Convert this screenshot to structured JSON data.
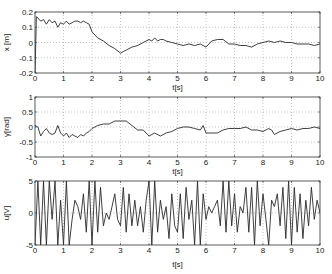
{
  "chart_data": [
    {
      "type": "line",
      "title": "",
      "xlabel": "t[s]",
      "ylabel": "x [m]",
      "xlim": [
        0,
        10
      ],
      "ylim": [
        -0.2,
        0.2
      ],
      "xticks": [
        "0",
        "1",
        "2",
        "3",
        "4",
        "5",
        "6",
        "7",
        "8",
        "9",
        "10"
      ],
      "yticks": [
        "-0.2",
        "-0.1",
        "0",
        "0.1",
        "0.2"
      ],
      "grid": true,
      "series": [
        {
          "name": "x",
          "x": [
            0,
            0.05,
            0.1,
            0.2,
            0.3,
            0.4,
            0.5,
            0.6,
            0.7,
            0.8,
            0.9,
            1.0,
            1.1,
            1.2,
            1.3,
            1.4,
            1.5,
            1.6,
            1.7,
            1.8,
            1.9,
            2.0,
            2.2,
            2.4,
            2.6,
            2.8,
            3.0,
            3.1,
            3.2,
            3.4,
            3.6,
            3.8,
            4.0,
            4.1,
            4.2,
            4.3,
            4.4,
            4.5,
            4.6,
            4.8,
            5.0,
            5.2,
            5.4,
            5.6,
            5.8,
            6.0,
            6.2,
            6.4,
            6.6,
            6.8,
            7.0,
            7.2,
            7.4,
            7.6,
            7.8,
            8.0,
            8.2,
            8.4,
            8.6,
            8.8,
            9.0,
            9.2,
            9.4,
            9.6,
            9.8,
            10.0
          ],
          "y": [
            -0.2,
            0.17,
            0.16,
            0.14,
            0.15,
            0.12,
            0.15,
            0.13,
            0.14,
            0.1,
            0.13,
            0.12,
            0.14,
            0.12,
            0.13,
            0.14,
            0.14,
            0.13,
            0.14,
            0.13,
            0.12,
            0.07,
            0.03,
            0.01,
            -0.02,
            -0.04,
            -0.07,
            -0.06,
            -0.05,
            -0.03,
            -0.02,
            0.0,
            0.02,
            0.01,
            0.03,
            0.01,
            0.02,
            0.02,
            0.01,
            0.0,
            -0.01,
            -0.02,
            -0.01,
            -0.02,
            -0.01,
            -0.03,
            0.01,
            0.02,
            0.02,
            -0.01,
            -0.01,
            -0.02,
            -0.02,
            -0.03,
            -0.01,
            0.0,
            0.01,
            0.0,
            0.01,
            0.0,
            0.0,
            -0.01,
            -0.01,
            -0.01,
            -0.02,
            -0.01
          ]
        }
      ]
    },
    {
      "type": "line",
      "title": "",
      "xlabel": "t[s]",
      "ylabel": "γ[rad]",
      "xlim": [
        0,
        10
      ],
      "ylim": [
        -1,
        1
      ],
      "xticks": [
        "0",
        "1",
        "2",
        "3",
        "4",
        "5",
        "6",
        "7",
        "8",
        "9",
        "10"
      ],
      "yticks": [
        "-1",
        "-0.5",
        "0",
        "0.5",
        "1"
      ],
      "grid": true,
      "series": [
        {
          "name": "gamma",
          "x": [
            0,
            0.1,
            0.2,
            0.3,
            0.4,
            0.5,
            0.6,
            0.7,
            0.8,
            0.9,
            1.0,
            1.1,
            1.2,
            1.3,
            1.4,
            1.5,
            1.6,
            1.7,
            1.8,
            1.9,
            2.0,
            2.2,
            2.4,
            2.6,
            2.8,
            3.0,
            3.2,
            3.4,
            3.6,
            3.8,
            4.0,
            4.2,
            4.4,
            4.6,
            4.8,
            5.0,
            5.2,
            5.4,
            5.6,
            5.8,
            5.9,
            6.0,
            6.2,
            6.4,
            6.6,
            6.8,
            7.0,
            7.2,
            7.4,
            7.6,
            7.8,
            8.0,
            8.2,
            8.3,
            8.4,
            8.6,
            8.8,
            9.0,
            9.2,
            9.4,
            9.6,
            9.8,
            10.0
          ],
          "y": [
            0.05,
            0.0,
            -0.3,
            -0.15,
            -0.05,
            -0.2,
            -0.25,
            -0.2,
            0.05,
            -0.2,
            -0.3,
            -0.2,
            -0.35,
            -0.25,
            -0.3,
            -0.35,
            -0.25,
            -0.3,
            -0.2,
            -0.15,
            -0.05,
            0.05,
            0.1,
            0.1,
            0.2,
            0.2,
            0.2,
            0.05,
            -0.1,
            -0.1,
            -0.3,
            -0.2,
            -0.3,
            -0.2,
            -0.15,
            -0.05,
            0.0,
            0.0,
            -0.05,
            -0.1,
            0.05,
            -0.2,
            -0.2,
            -0.2,
            -0.1,
            -0.05,
            -0.05,
            -0.05,
            0.0,
            -0.1,
            -0.1,
            -0.15,
            -0.05,
            -0.1,
            -0.25,
            -0.15,
            -0.1,
            -0.05,
            -0.1,
            -0.05,
            -0.05,
            0.0,
            -0.05
          ]
        }
      ]
    },
    {
      "type": "line",
      "title": "",
      "xlabel": "t[s]",
      "ylabel": "u[V]",
      "xlim": [
        0,
        10
      ],
      "ylim": [
        -5,
        5
      ],
      "xticks": [
        "0",
        "1",
        "2",
        "3",
        "4",
        "5",
        "6",
        "7",
        "8",
        "9",
        "10"
      ],
      "yticks": [
        "-5",
        "0",
        "5"
      ],
      "grid": true,
      "series": [
        {
          "name": "u",
          "x": [
            0,
            0.1,
            0.2,
            0.3,
            0.4,
            0.5,
            0.6,
            0.7,
            0.8,
            0.9,
            1.0,
            1.1,
            1.2,
            1.3,
            1.4,
            1.5,
            1.6,
            1.7,
            1.8,
            1.9,
            2.0,
            2.1,
            2.2,
            2.3,
            2.4,
            2.5,
            2.6,
            2.7,
            2.8,
            2.9,
            3.0,
            3.1,
            3.2,
            3.3,
            3.4,
            3.5,
            3.6,
            3.7,
            3.8,
            3.9,
            4.0,
            4.1,
            4.2,
            4.3,
            4.4,
            4.5,
            4.6,
            4.7,
            4.8,
            4.9,
            5.0,
            5.1,
            5.2,
            5.3,
            5.4,
            5.5,
            5.6,
            5.7,
            5.8,
            5.9,
            6.0,
            6.1,
            6.2,
            6.3,
            6.4,
            6.5,
            6.6,
            6.7,
            6.8,
            6.9,
            7.0,
            7.1,
            7.2,
            7.3,
            7.4,
            7.5,
            7.6,
            7.7,
            7.8,
            7.9,
            8.0,
            8.1,
            8.2,
            8.3,
            8.4,
            8.5,
            8.6,
            8.7,
            8.8,
            8.9,
            9.0,
            9.1,
            9.2,
            9.3,
            9.4,
            9.5,
            9.6,
            9.7,
            9.8,
            9.9,
            10.0
          ],
          "y": [
            -5,
            5,
            -5,
            5,
            -5,
            5,
            -1,
            5,
            -5,
            2,
            -5,
            5,
            -5,
            -1,
            2,
            1,
            -1,
            3,
            -3,
            5,
            -5,
            5,
            -3,
            4,
            -2,
            0,
            -1,
            1,
            3,
            -1,
            -2,
            4,
            -3,
            3,
            -2,
            2,
            -2,
            1,
            -3,
            2,
            5,
            -5,
            5,
            -3,
            2,
            -1,
            1,
            -4,
            3,
            -2,
            -3,
            3,
            -4,
            4,
            -1,
            2,
            -5,
            5,
            -5,
            3,
            -1,
            1,
            0,
            1,
            2,
            -2,
            5,
            -3,
            5,
            -2,
            3,
            -3,
            1,
            0,
            4,
            -3,
            4,
            -5,
            5,
            -2,
            3,
            -1,
            -5,
            2,
            1,
            3,
            -2,
            4,
            -4,
            5,
            -5,
            4,
            -3,
            3,
            -4,
            2,
            -2,
            4,
            -1,
            2,
            0
          ]
        }
      ]
    }
  ],
  "axes": [
    {
      "ylabel": "x [m]",
      "xlabel": "t[s]",
      "yticks": [
        "0.2",
        "0.1",
        "0",
        "-0.1",
        "-0.2"
      ]
    },
    {
      "ylabel": "γ[rad]",
      "xlabel": "t[s]",
      "yticks": [
        "1",
        "0.5",
        "0",
        "-0.5",
        "-1"
      ]
    },
    {
      "ylabel": "u[V]",
      "xlabel": "t[s]",
      "yticks": [
        "5",
        "0",
        "-5"
      ]
    }
  ],
  "xticks": [
    "0",
    "1",
    "2",
    "3",
    "4",
    "5",
    "6",
    "7",
    "8",
    "9",
    "10"
  ],
  "colors": {
    "line": "#2a2a2a",
    "grid": "#9a9a9a",
    "axis": "#333333"
  }
}
